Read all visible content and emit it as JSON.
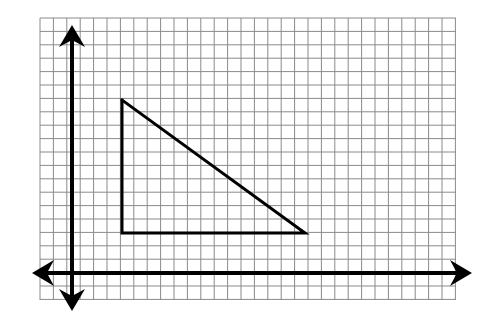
{
  "figure": {
    "background_color": "#ffffff",
    "canvas": {
      "width": 491,
      "height": 333
    }
  },
  "grid": {
    "name": "graph-paper-grid",
    "line_color": "#8a8a8a",
    "line_width": 1,
    "cell_size": 13.4,
    "left": 40,
    "top": 18,
    "right": 456,
    "bottom": 300,
    "columns": 31,
    "rows": 21
  },
  "axes": {
    "color": "#000000",
    "line_width": 4,
    "origin": {
      "x": 72,
      "y": 273
    },
    "x_axis": {
      "name": "x-axis",
      "start_x": 36,
      "end_x": 468,
      "y": 273,
      "arrow_left": true,
      "arrow_right": true
    },
    "y_axis": {
      "name": "y-axis",
      "x": 72,
      "start_y": 29,
      "end_y": 307,
      "arrow_up": true,
      "arrow_down": true
    }
  },
  "shape": {
    "name": "right-triangle",
    "type": "polyline",
    "closed": false,
    "stroke_color": "#000000",
    "stroke_width": 3,
    "fill": "none",
    "vertices": [
      {
        "label": "top-vertex",
        "x": 122,
        "y": 100
      },
      {
        "label": "right-angle-vertex",
        "x": 122,
        "y": 233
      },
      {
        "label": "bottom-right-vertex",
        "x": 305,
        "y": 233
      }
    ],
    "edges": [
      {
        "name": "vertical-leg",
        "from": "top-vertex",
        "to": "right-angle-vertex"
      },
      {
        "name": "horizontal-leg",
        "from": "right-angle-vertex",
        "to": "bottom-right-vertex"
      },
      {
        "name": "hypotenuse",
        "from": "top-vertex",
        "to": "bottom-right-vertex"
      }
    ]
  },
  "chart_data": {
    "type": "scatter",
    "title": "",
    "xlabel": "",
    "ylabel": "",
    "grid": true,
    "legend": null,
    "series": [
      {
        "name": "right-triangle",
        "x": [
          3.7,
          3.7,
          17.4,
          3.7
        ],
        "y": [
          12.9,
          3.0,
          3.0,
          12.9
        ]
      }
    ],
    "xlim": [
      -2.4,
      28.7
    ],
    "ylim": [
      -2.0,
      19.0
    ],
    "annotations": [
      "Vertical leg spans 10 grid units",
      "Horizontal leg spans about 13.7 grid units",
      "Right angle at lower-left vertex of the triangle"
    ]
  }
}
